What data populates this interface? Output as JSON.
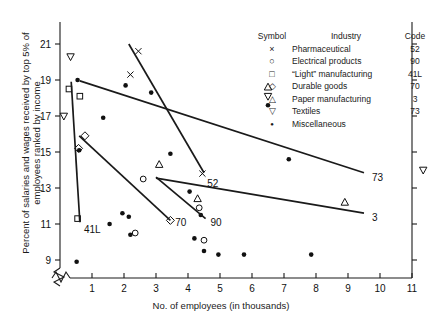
{
  "chart_data": {
    "type": "scatter",
    "title": "",
    "xlabel": "No. of employees (in thousands)",
    "ylabel": "Percent of salaries and wages received by top 5% of employees ranked by income",
    "xlim": [
      0,
      11
    ],
    "ylim": [
      8,
      22
    ],
    "xticks": [
      1,
      2,
      3,
      4,
      5,
      6,
      7,
      8,
      9,
      10,
      11
    ],
    "yticks": [
      9,
      11,
      13,
      15,
      17,
      19,
      21
    ],
    "grid": false,
    "axis_break_x": true,
    "axis_break_y": true,
    "legend": {
      "position": "top-right",
      "headers": [
        "Symbol",
        "Industry",
        "Code"
      ],
      "entries": [
        {
          "symbol": "x",
          "industry": "Pharmaceutical",
          "code": "52"
        },
        {
          "symbol": "o",
          "industry": "Electrical products",
          "code": "90"
        },
        {
          "symbol": "square",
          "industry": "“Light” manufacturing",
          "code": "41L"
        },
        {
          "symbol": "diamond",
          "industry": "Durable goods",
          "code": "70"
        },
        {
          "symbol": "triangle-up",
          "industry": "Paper manufacturing",
          "code": "3"
        },
        {
          "symbol": "triangle-down",
          "industry": "Textiles",
          "code": "73"
        },
        {
          "symbol": "dot",
          "industry": "Miscellaneous",
          "code": ""
        }
      ]
    },
    "series": [
      {
        "name": "Pharmaceutical",
        "code": "52",
        "symbol": "x",
        "points": [
          [
            2.45,
            20.6
          ],
          [
            2.2,
            19.3
          ],
          [
            4.45,
            13.8
          ]
        ]
      },
      {
        "name": "Electrical products",
        "code": "90",
        "symbol": "o",
        "points": [
          [
            2.6,
            13.5
          ],
          [
            2.35,
            10.5
          ],
          [
            4.35,
            11.9
          ],
          [
            4.5,
            10.1
          ]
        ]
      },
      {
        "name": "“Light” manufacturing",
        "code": "41L",
        "symbol": "square",
        "points": [
          [
            0.28,
            18.5
          ],
          [
            0.62,
            18.1
          ],
          [
            0.55,
            11.3
          ]
        ]
      },
      {
        "name": "Durable goods",
        "code": "70",
        "symbol": "diamond",
        "points": [
          [
            0.78,
            15.9
          ],
          [
            0.58,
            15.2
          ],
          [
            3.45,
            11.2
          ]
        ]
      },
      {
        "name": "Paper manufacturing",
        "code": "3",
        "symbol": "triangle-up",
        "points": [
          [
            3.1,
            14.3
          ],
          [
            4.3,
            12.4
          ],
          [
            8.9,
            12.2
          ],
          [
            6.5,
            18.6
          ]
        ]
      },
      {
        "name": "Textiles",
        "code": "73",
        "symbol": "triangle-down",
        "points": [
          [
            0.33,
            20.3
          ],
          [
            0.12,
            17.0
          ],
          [
            6.5,
            18.1
          ],
          [
            11.35,
            14.0
          ]
        ]
      },
      {
        "name": "Miscellaneous",
        "code": "",
        "symbol": "dot",
        "points": [
          [
            0.55,
            19.0
          ],
          [
            1.35,
            16.9
          ],
          [
            0.6,
            15.1
          ],
          [
            2.05,
            18.7
          ],
          [
            2.85,
            18.3
          ],
          [
            3.45,
            14.9
          ],
          [
            4.05,
            12.8
          ],
          [
            4.4,
            11.5
          ],
          [
            1.95,
            11.6
          ],
          [
            2.15,
            11.4
          ],
          [
            1.55,
            11.0
          ],
          [
            2.2,
            10.4
          ],
          [
            4.5,
            9.5
          ],
          [
            4.95,
            9.3
          ],
          [
            6.5,
            17.6
          ],
          [
            7.15,
            14.6
          ],
          [
            5.75,
            9.3
          ],
          [
            7.85,
            9.3
          ],
          [
            0.52,
            8.9
          ],
          [
            4.2,
            10.2
          ]
        ]
      }
    ],
    "trend_lines": [
      {
        "code": "52",
        "from": [
          2.15,
          21.0
        ],
        "to": [
          4.5,
          13.85
        ],
        "label_pos": [
          4.6,
          13.3
        ]
      },
      {
        "code": "90",
        "from": [
          3.0,
          13.6
        ],
        "to": [
          4.55,
          11.3
        ],
        "label_pos": [
          4.7,
          11.1
        ]
      },
      {
        "code": "41L",
        "from": [
          0.35,
          18.9
        ],
        "to": [
          0.62,
          11.1
        ],
        "label_pos": [
          0.75,
          10.7
        ]
      },
      {
        "code": "70",
        "from": [
          0.6,
          15.9
        ],
        "to": [
          3.45,
          11.2
        ],
        "label_pos": [
          3.6,
          11.1
        ]
      },
      {
        "code": "73",
        "from": [
          0.62,
          18.95
        ],
        "to": [
          9.5,
          13.85
        ],
        "label_pos": [
          9.75,
          13.6
        ]
      },
      {
        "code": "3",
        "from": [
          3.0,
          13.55
        ],
        "to": [
          9.5,
          11.6
        ],
        "label_pos": [
          9.75,
          11.4
        ]
      }
    ]
  }
}
